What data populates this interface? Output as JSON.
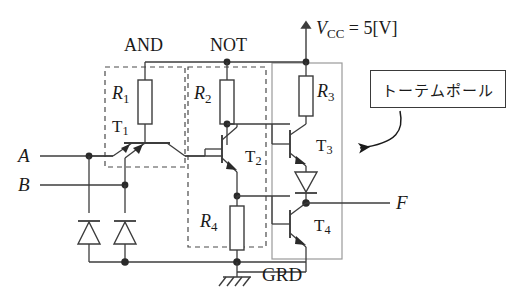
{
  "diagram": {
    "labels": {
      "vcc": "V",
      "vcc_sub": "CC",
      "vcc_value": " = 5[V]",
      "and_stage": "AND",
      "not_stage": "NOT",
      "grd": "GRD",
      "input_a": "A",
      "input_b": "B",
      "output_f": "F",
      "annotation_box": "トーテムポール"
    },
    "resistors": [
      {
        "name": "R",
        "sub": "1"
      },
      {
        "name": "R",
        "sub": "2"
      },
      {
        "name": "R",
        "sub": "3"
      },
      {
        "name": "R",
        "sub": "4"
      }
    ],
    "transistors": [
      {
        "name": "T",
        "sub": "1"
      },
      {
        "name": "T",
        "sub": "2"
      },
      {
        "name": "T",
        "sub": "3"
      },
      {
        "name": "T",
        "sub": "4"
      }
    ],
    "colors": {
      "wire": "#3c3c3c",
      "dashed_box": "#4a4a4a",
      "solid_box": "#8a8a8a",
      "text": "#1a1a1a",
      "background": "#ffffff"
    }
  }
}
